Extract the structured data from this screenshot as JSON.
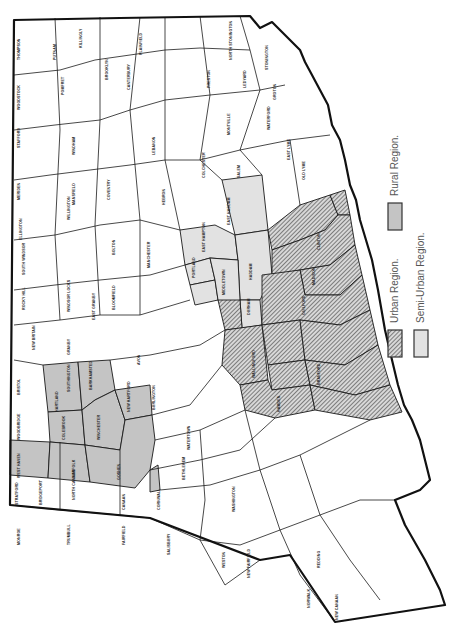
{
  "map": {
    "title": "Connecticut town regions",
    "orientation": "rotated 90 degrees counter-clockwise",
    "colors": {
      "rural": "#c4c4c4",
      "semi_urban": "#e2e2e2",
      "urban_hatch": "#555555",
      "plain": "#ffffff",
      "border": "#111111"
    }
  },
  "legend": {
    "items": [
      {
        "key": "urban",
        "label": "Urban Region."
      },
      {
        "key": "semi_urban",
        "label": "Semi-Urban Region."
      },
      {
        "key": "rural",
        "label": "Rural Region."
      }
    ]
  },
  "towns": {
    "rural": [
      "Barkhamsted",
      "New Hartford",
      "Winchester",
      "Torrington",
      "Norfolk",
      "Goshen",
      "Litchfield",
      "Burlington",
      "Harwinton",
      "Morris",
      "Colebrook"
    ],
    "semi_urban": [
      "East Hampton",
      "Portland",
      "Cromwell",
      "Haddam",
      "East Haddam",
      "Middletown",
      "Durham",
      "Marlborough"
    ],
    "urban": [
      "Clinton",
      "Old Saybrook",
      "Westbrook",
      "Killingworth",
      "Madison",
      "Guilford",
      "North Branford",
      "Branford",
      "East Haven",
      "North Haven",
      "Wallingford",
      "Meriden",
      "Middlefield",
      "Chester",
      "Deep River",
      "Essex",
      "Hamden",
      "New Haven",
      "West Haven"
    ],
    "labels": [
      {
        "name": "THOMPSON",
        "x": 18,
        "y": 60
      },
      {
        "name": "PUTNAM",
        "x": 55,
        "y": 60
      },
      {
        "name": "KILLINGLY",
        "x": 80,
        "y": 45
      },
      {
        "name": "WOODSTOCK",
        "x": 18,
        "y": 105
      },
      {
        "name": "POMFRET",
        "x": 63,
        "y": 90
      },
      {
        "name": "BROOKLYN",
        "x": 107,
        "y": 75
      },
      {
        "name": "CANTERBURY",
        "x": 130,
        "y": 85
      },
      {
        "name": "PLAINFIELD",
        "x": 140,
        "y": 50
      },
      {
        "name": "STERLING",
        "x": 165,
        "y": 30
      },
      {
        "name": "VOLUNTOWN",
        "x": 175,
        "y": 35
      },
      {
        "name": "EASTFORD",
        "x": 63,
        "y": 115
      },
      {
        "name": "HAMPTON",
        "x": 100,
        "y": 105
      },
      {
        "name": "CHAPLIN",
        "x": 100,
        "y": 130
      },
      {
        "name": "SCOTLAND",
        "x": 130,
        "y": 110
      },
      {
        "name": "SPRAGUE",
        "x": 170,
        "y": 105
      },
      {
        "name": "GRISWOLD",
        "x": 175,
        "y": 65
      },
      {
        "name": "LISBON",
        "x": 178,
        "y": 82
      },
      {
        "name": "NORTH STONINGTON",
        "x": 230,
        "y": 40
      },
      {
        "name": "STONINGTON",
        "x": 268,
        "y": 55
      },
      {
        "name": "PRESTON",
        "x": 210,
        "y": 80
      },
      {
        "name": "LEDYARD",
        "x": 245,
        "y": 80
      },
      {
        "name": "GROTON",
        "x": 275,
        "y": 95
      },
      {
        "name": "NEW LONDON",
        "x": 290,
        "y": 110
      },
      {
        "name": "WATERFORD",
        "x": 270,
        "y": 120
      },
      {
        "name": "MONTVILLE",
        "x": 230,
        "y": 125
      },
      {
        "name": "BOZRAH",
        "x": 200,
        "y": 130
      },
      {
        "name": "FRANKLIN",
        "x": 190,
        "y": 120
      },
      {
        "name": "NORWICH",
        "x": 215,
        "y": 105
      },
      {
        "name": "EAST LYME",
        "x": 290,
        "y": 150
      },
      {
        "name": "OLD LYME",
        "x": 305,
        "y": 170
      },
      {
        "name": "LYME",
        "x": 270,
        "y": 180
      },
      {
        "name": "SALEM",
        "x": 240,
        "y": 170
      },
      {
        "name": "WINDHAM",
        "x": 75,
        "y": 145
      },
      {
        "name": "LEBANON",
        "x": 155,
        "y": 145
      },
      {
        "name": "COLCHESTER",
        "x": 205,
        "y": 165
      },
      {
        "name": "MANSFIELD",
        "x": 75,
        "y": 195
      },
      {
        "name": "COVENTRY",
        "x": 110,
        "y": 190
      },
      {
        "name": "ANDOVER",
        "x": 130,
        "y": 200
      },
      {
        "name": "COLUMBIA",
        "x": 140,
        "y": 175
      },
      {
        "name": "HEBRON",
        "x": 165,
        "y": 195
      },
      {
        "name": "MARLBOROUGH",
        "x": 180,
        "y": 235
      },
      {
        "name": "EAST HADDAM",
        "x": 227,
        "y": 220
      },
      {
        "name": "EAST HAMPTON",
        "x": 210,
        "y": 240
      },
      {
        "name": "HADDAM",
        "x": 240,
        "y": 270
      },
      {
        "name": "CHESTER",
        "x": 275,
        "y": 230
      },
      {
        "name": "DEEP RIVER",
        "x": 290,
        "y": 215
      },
      {
        "name": "ESSEX",
        "x": 300,
        "y": 205
      },
      {
        "name": "WESTBROOK",
        "x": 322,
        "y": 215
      },
      {
        "name": "OLD SAYBROOK",
        "x": 320,
        "y": 190
      },
      {
        "name": "CLINTON",
        "x": 320,
        "y": 240
      },
      {
        "name": "KILLINGWORTH",
        "x": 290,
        "y": 260
      },
      {
        "name": "MADISON",
        "x": 315,
        "y": 275
      },
      {
        "name": "GUILFORD",
        "x": 305,
        "y": 305
      },
      {
        "name": "DURHAM",
        "x": 255,
        "y": 320
      },
      {
        "name": "MIDDLETOWN",
        "x": 220,
        "y": 305
      },
      {
        "name": "MIDDLEFIELD",
        "x": 235,
        "y": 335
      },
      {
        "name": "PORTLAND",
        "x": 185,
        "y": 265
      },
      {
        "name": "CROMWELL",
        "x": 195,
        "y": 300
      },
      {
        "name": "WALLINGFORD",
        "x": 255,
        "y": 370
      },
      {
        "name": "NORTH BRANFORD",
        "x": 285,
        "y": 355
      },
      {
        "name": "BRANFORD",
        "x": 310,
        "y": 380
      },
      {
        "name": "EAST HAVEN",
        "x": 320,
        "y": 405
      },
      {
        "name": "NORTH HAVEN",
        "x": 285,
        "y": 385
      },
      {
        "name": "HAMDEN",
        "x": 280,
        "y": 410
      },
      {
        "name": "NEW HAVEN",
        "x": 325,
        "y": 415
      },
      {
        "name": "MERIDEN",
        "x": 230,
        "y": 365
      },
      {
        "name": "STAFFORD",
        "x": 20,
        "y": 190
      },
      {
        "name": "UNION",
        "x": 18,
        "y": 140
      },
      {
        "name": "ASHFORD",
        "x": 50,
        "y": 140
      },
      {
        "name": "WILLINGTON",
        "x": 55,
        "y": 165
      },
      {
        "name": "TOLLAND",
        "x": 70,
        "y": 210
      },
      {
        "name": "ELLINGTON",
        "x": 55,
        "y": 230
      },
      {
        "name": "SOMERS",
        "x": 22,
        "y": 230
      },
      {
        "name": "VERNON",
        "x": 90,
        "y": 230
      },
      {
        "name": "BOLTON",
        "x": 115,
        "y": 215
      },
      {
        "name": "MANCHESTER",
        "x": 115,
        "y": 245
      },
      {
        "name": "GLASTONBURY",
        "x": 150,
        "y": 255
      },
      {
        "name": "EAST WINDSOR",
        "x": 60,
        "y": 265
      },
      {
        "name": "SOUTH WINDSOR",
        "x": 90,
        "y": 270
      },
      {
        "name": "ENFIELD",
        "x": 25,
        "y": 265
      },
      {
        "name": "EAST HARTFORD",
        "x": 120,
        "y": 280
      },
      {
        "name": "WETHERSFIELD",
        "x": 155,
        "y": 290
      },
      {
        "name": "ROCKY HILL",
        "x": 165,
        "y": 305
      },
      {
        "name": "SUFFIELD",
        "x": 25,
        "y": 300
      },
      {
        "name": "WINDSOR LOCKS",
        "x": 55,
        "y": 290
      },
      {
        "name": "WINDSOR",
        "x": 70,
        "y": 305
      },
      {
        "name": "EAST GRANBY",
        "x": 55,
        "y": 320
      },
      {
        "name": "BLOOMFIELD",
        "x": 95,
        "y": 310
      },
      {
        "name": "HARTFORD",
        "x": 115,
        "y": 300
      },
      {
        "name": "WEST HARTFORD",
        "x": 125,
        "y": 325
      },
      {
        "name": "NEWINGTON",
        "x": 150,
        "y": 320
      },
      {
        "name": "BERLIN",
        "x": 185,
        "y": 325
      },
      {
        "name": "NEW BRITAIN",
        "x": 165,
        "y": 335
      },
      {
        "name": "GRANBY",
        "x": 35,
        "y": 340
      },
      {
        "name": "SIMSBURY",
        "x": 70,
        "y": 345
      },
      {
        "name": "AVON",
        "x": 105,
        "y": 345
      },
      {
        "name": "FARMINGTON",
        "x": 140,
        "y": 355
      },
      {
        "name": "PLAINVILLE",
        "x": 165,
        "y": 365
      },
      {
        "name": "SOUTHINGTON",
        "x": 185,
        "y": 375
      },
      {
        "name": "CANTON",
        "x": 70,
        "y": 385
      },
      {
        "name": "BURLINGTON",
        "x": 120,
        "y": 390
      },
      {
        "name": "BRISTOL",
        "x": 155,
        "y": 400
      },
      {
        "name": "HARTLAND",
        "x": 20,
        "y": 385
      },
      {
        "name": "BARKHAMSTED",
        "x": 55,
        "y": 400
      },
      {
        "name": "NEW HARTFORD",
        "x": 85,
        "y": 400
      },
      {
        "name": "HARWINTON",
        "x": 120,
        "y": 420
      },
      {
        "name": "PLYMOUTH",
        "x": 165,
        "y": 420
      },
      {
        "name": "WOLCOTT",
        "x": 185,
        "y": 405
      },
      {
        "name": "CHESHIRE",
        "x": 205,
        "y": 390
      },
      {
        "name": "PROSPECT",
        "x": 215,
        "y": 405
      },
      {
        "name": "BETHANY",
        "x": 230,
        "y": 420
      },
      {
        "name": "WOODBRIDGE",
        "x": 265,
        "y": 425
      },
      {
        "name": "COLEBROOK",
        "x": 18,
        "y": 430
      },
      {
        "name": "WINCHESTER",
        "x": 55,
        "y": 435
      },
      {
        "name": "TORRINGTON",
        "x": 95,
        "y": 435
      },
      {
        "name": "THOMASTON",
        "x": 150,
        "y": 440
      },
      {
        "name": "WATERTOWN",
        "x": 150,
        "y": 460
      },
      {
        "name": "WATERBURY",
        "x": 190,
        "y": 440
      },
      {
        "name": "NAUGATUCK",
        "x": 220,
        "y": 445
      },
      {
        "name": "ORANGE",
        "x": 280,
        "y": 455
      },
      {
        "name": "MILFORD",
        "x": 300,
        "y": 460
      },
      {
        "name": "WEST HAVEN",
        "x": 310,
        "y": 440
      },
      {
        "name": "NORFOLK",
        "x": 20,
        "y": 470
      },
      {
        "name": "GOSHEN",
        "x": 75,
        "y": 470
      },
      {
        "name": "LITCHFIELD",
        "x": 115,
        "y": 470
      },
      {
        "name": "MORRIS",
        "x": 150,
        "y": 480
      },
      {
        "name": "BETHLEHEM",
        "x": 160,
        "y": 465
      },
      {
        "name": "WOODBURY",
        "x": 185,
        "y": 470
      },
      {
        "name": "MIDDLEBURY",
        "x": 200,
        "y": 455
      },
      {
        "name": "OXFORD",
        "x": 245,
        "y": 470
      },
      {
        "name": "SEYMOUR",
        "x": 240,
        "y": 455
      },
      {
        "name": "DERBY",
        "x": 265,
        "y": 470
      },
      {
        "name": "SHELTON",
        "x": 280,
        "y": 485
      },
      {
        "name": "STRATFORD",
        "x": 305,
        "y": 490
      },
      {
        "name": "BRIDGEPORT",
        "x": 325,
        "y": 480
      },
      {
        "name": "NORTH CANAAN",
        "x": 18,
        "y": 500
      },
      {
        "name": "CANAAN",
        "x": 40,
        "y": 505
      },
      {
        "name": "CORNWALL",
        "x": 75,
        "y": 495
      },
      {
        "name": "WARREN",
        "x": 125,
        "y": 505
      },
      {
        "name": "WASHINGTON",
        "x": 155,
        "y": 505
      },
      {
        "name": "SOUTHBURY",
        "x": 205,
        "y": 500
      },
      {
        "name": "NEWTOWN",
        "x": 235,
        "y": 505
      },
      {
        "name": "MONROE",
        "x": 265,
        "y": 500
      },
      {
        "name": "TRUMBULL",
        "x": 290,
        "y": 505
      },
      {
        "name": "FAIRFIELD",
        "x": 320,
        "y": 515
      },
      {
        "name": "SALISBURY",
        "x": 18,
        "y": 540
      },
      {
        "name": "SHARON",
        "x": 70,
        "y": 540
      },
      {
        "name": "KENT",
        "x": 125,
        "y": 540
      },
      {
        "name": "NEW MILFORD",
        "x": 170,
        "y": 545
      },
      {
        "name": "BROOKFIELD",
        "x": 210,
        "y": 525
      },
      {
        "name": "BETHEL",
        "x": 240,
        "y": 525
      },
      {
        "name": "EASTON",
        "x": 295,
        "y": 525
      },
      {
        "name": "WESTON",
        "x": 290,
        "y": 545
      },
      {
        "name": "WESTPORT",
        "x": 320,
        "y": 540
      },
      {
        "name": "NEW FAIRFIELD",
        "x": 190,
        "y": 560
      },
      {
        "name": "DANBURY",
        "x": 225,
        "y": 560
      },
      {
        "name": "REDDING",
        "x": 255,
        "y": 545
      },
      {
        "name": "RIDGEFIELD",
        "x": 250,
        "y": 570
      },
      {
        "name": "WILTON",
        "x": 290,
        "y": 565
      },
      {
        "name": "NORWALK",
        "x": 320,
        "y": 560
      },
      {
        "name": "NEW CANAAN",
        "x": 300,
        "y": 585
      },
      {
        "name": "DARIEN",
        "x": 340,
        "y": 585
      },
      {
        "name": "STAMFORD",
        "x": 310,
        "y": 600
      },
      {
        "name": "GREENWICH",
        "x": 335,
        "y": 615
      }
    ]
  }
}
